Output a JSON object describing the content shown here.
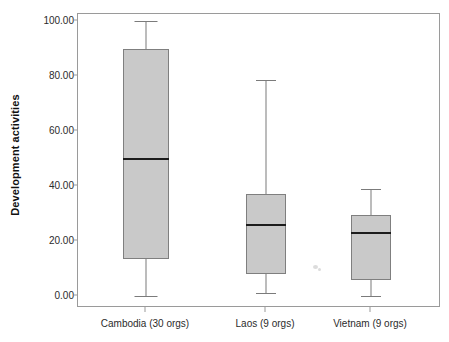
{
  "chart_data": {
    "type": "box",
    "title": "",
    "xlabel": "",
    "ylabel": "Development activities",
    "ylim": [
      0,
      100
    ],
    "yticks": [
      "0.00",
      "20.00",
      "40.00",
      "60.00",
      "80.00",
      "100.00"
    ],
    "ytick_values": [
      0,
      20,
      40,
      60,
      80,
      100
    ],
    "grid": false,
    "legend": "none",
    "categories": [
      "Cambodia (30 orgs)",
      "Laos (9 orgs)",
      "Vietnam (9 orgs)"
    ],
    "boxes": [
      {
        "label": "Cambodia (30 orgs)",
        "n": 30,
        "min": 0.0,
        "q1": 13.5,
        "median": 50.0,
        "q3": 90.0,
        "max": 100.0
      },
      {
        "label": "Laos (9 orgs)",
        "n": 9,
        "min": 1.0,
        "q1": 8.0,
        "median": 26.0,
        "q3": 37.0,
        "max": 78.5
      },
      {
        "label": "Vietnam (9 orgs)",
        "n": 9,
        "min": 0.0,
        "q1": 6.0,
        "median": 23.0,
        "q3": 29.5,
        "max": 39.0
      }
    ],
    "colors": {
      "box_fill": "#c9c9c9",
      "box_edge": "#7f7f7f",
      "median": "#1c1c1c",
      "whisker": "#7b7b7b",
      "frame": "#9a9a9a",
      "text": "#2b2b2b",
      "background": "#ffffff"
    }
  },
  "axis": {
    "y_title": "Development activities"
  }
}
